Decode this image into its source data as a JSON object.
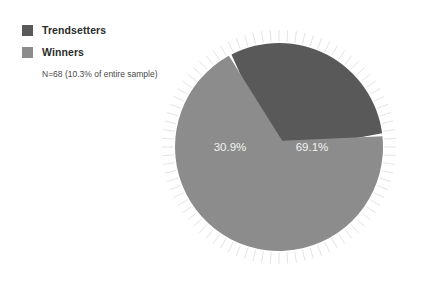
{
  "legend": {
    "items": [
      {
        "label": "Trendsetters",
        "color": "#595959",
        "swatch_name": "legend-swatch-trendsetters"
      },
      {
        "label": "Winners",
        "color": "#8c8c8c",
        "swatch_name": "legend-swatch-winners"
      }
    ],
    "note": "N=68 (10.3% of entire sample)"
  },
  "chart_data": {
    "type": "pie",
    "title": "",
    "categories": [
      "Trendsetters",
      "Winners"
    ],
    "values": [
      30.9,
      69.1
    ],
    "labels": [
      "30.9%",
      "69.1%"
    ],
    "colors": [
      "#595959",
      "#8c8c8c"
    ],
    "legend_position": "top-left",
    "annotations": [
      "N=68 (10.3% of entire sample)"
    ],
    "units": "percent",
    "total": 100.0,
    "sample_size": 68,
    "sample_share_of_total": "10.3%",
    "grid": false,
    "decoration": "radial sunburst tick marks around circumference",
    "slice_separator_color": "#ffffff"
  },
  "geometry": {
    "center_x": 119,
    "center_y": 129,
    "radius": 104,
    "dark_label_x": 70,
    "dark_label_y": 133,
    "light_label_x": 152,
    "light_label_y": 133
  }
}
